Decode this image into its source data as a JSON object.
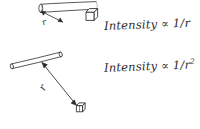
{
  "figure": {
    "background_color": "#ffffff",
    "ink_color": "#2b2b2b",
    "width": 200,
    "height": 129
  },
  "panels": [
    {
      "id": "linear-source-panel",
      "source_label": "long-tube-light-source",
      "detector_label": "cube-detector",
      "distance_label": "r",
      "formula": "Intensity ∝ 1/r"
    },
    {
      "id": "point-source-panel",
      "source_label": "short-rod-light-source",
      "detector_label": "cube-detector",
      "distance_label": "r",
      "formula_prefix": "Intensity ∝ 1/r",
      "formula_exponent": "2",
      "formula": "Intensity ∝ 1/r²"
    }
  ],
  "annotations": {
    "linear_formula": "Intensity ∝ 1/r",
    "inverse_square_formula_base": "Intensity ∝ 1/r",
    "inverse_square_exponent": "2",
    "distance_symbol_top": "r",
    "distance_symbol_bottom": "r"
  }
}
